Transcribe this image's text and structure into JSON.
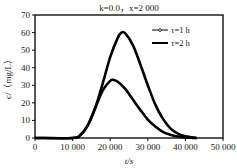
{
  "chart_data": {
    "type": "line",
    "title": "k=0.0，x=2 000",
    "xlabel": "t/s",
    "ylabel": "c/（mg/L）",
    "xlim": [
      0,
      50000
    ],
    "ylim": [
      0,
      70
    ],
    "xticks": [
      0,
      10000,
      20000,
      30000,
      40000,
      50000
    ],
    "xtick_labels": [
      "0",
      "10 000",
      "20 000",
      "30 000",
      "40 000",
      "50 000"
    ],
    "yticks": [
      0,
      10,
      20,
      30,
      40,
      50,
      60,
      70
    ],
    "ytick_labels": [
      "0",
      "10",
      "20",
      "30",
      "40",
      "50",
      "60",
      "70"
    ],
    "grid": false,
    "legend_position": "upper right",
    "series": [
      {
        "name": "τ=1 h",
        "x": [
          0,
          10000,
          12000,
          14000,
          16000,
          18000,
          20000,
          21000,
          22000,
          24000,
          26000,
          28000,
          30000,
          32000,
          34000,
          36000,
          38000,
          40000,
          43000
        ],
        "values": [
          0,
          0,
          1.5,
          7,
          17,
          27,
          32.5,
          33,
          32,
          28,
          22,
          16,
          10.5,
          6.5,
          3.5,
          1.8,
          0.8,
          0.3,
          0
        ]
      },
      {
        "name": "τ=2 h",
        "x": [
          0,
          10000,
          12000,
          14000,
          16000,
          18000,
          20000,
          22000,
          23000,
          24000,
          26000,
          28000,
          30000,
          32000,
          34000,
          36000,
          38000,
          40000,
          43000
        ],
        "values": [
          0,
          0,
          1.5,
          7,
          17,
          31,
          46,
          57,
          60,
          59.5,
          53,
          42,
          30,
          19,
          11,
          5.5,
          2.5,
          1,
          0
        ]
      }
    ]
  },
  "legend": {
    "items": [
      {
        "label": "τ=1 h",
        "marker": "circle-line"
      },
      {
        "label": "τ=2 h",
        "marker": "line"
      }
    ]
  }
}
